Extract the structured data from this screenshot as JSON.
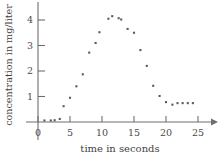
{
  "chart_data": {
    "type": "scatter",
    "title": "",
    "xlabel": "time in seconds",
    "ylabel": "concentration in mg/liter",
    "xlim": [
      -1,
      27
    ],
    "ylim": [
      -0.25,
      4.6
    ],
    "xticks": [
      0,
      5,
      10,
      15,
      20,
      25
    ],
    "yticks": [
      1,
      2,
      3,
      4
    ],
    "xtick_labels": [
      "0",
      "5",
      "10",
      "15",
      "20",
      "25"
    ],
    "ytick_labels": [
      "1",
      "2",
      "3",
      "4"
    ],
    "grid": false,
    "legend": null,
    "marker_color": "#5b5b5b",
    "axis_color": "#6e6e6e",
    "points": [
      {
        "x": 1,
        "y": 0.06
      },
      {
        "x": 2,
        "y": 0.06
      },
      {
        "x": 2.6,
        "y": 0.07
      },
      {
        "x": 3.4,
        "y": 0.12
      },
      {
        "x": 4,
        "y": 0.62
      },
      {
        "x": 5,
        "y": 0.95
      },
      {
        "x": 6,
        "y": 1.4
      },
      {
        "x": 7,
        "y": 1.87
      },
      {
        "x": 8,
        "y": 2.72
      },
      {
        "x": 9,
        "y": 3.1
      },
      {
        "x": 9.6,
        "y": 3.52
      },
      {
        "x": 11,
        "y": 4.05
      },
      {
        "x": 11.6,
        "y": 4.15
      },
      {
        "x": 12.6,
        "y": 4.07
      },
      {
        "x": 13,
        "y": 4.02
      },
      {
        "x": 14,
        "y": 3.65
      },
      {
        "x": 15,
        "y": 3.5
      },
      {
        "x": 16,
        "y": 2.82
      },
      {
        "x": 17,
        "y": 2.2
      },
      {
        "x": 18,
        "y": 1.42
      },
      {
        "x": 19,
        "y": 1.02
      },
      {
        "x": 20,
        "y": 0.78
      },
      {
        "x": 21,
        "y": 0.68
      },
      {
        "x": 21.8,
        "y": 0.74
      },
      {
        "x": 22.6,
        "y": 0.74
      },
      {
        "x": 23.4,
        "y": 0.74
      },
      {
        "x": 24.2,
        "y": 0.74
      }
    ]
  }
}
